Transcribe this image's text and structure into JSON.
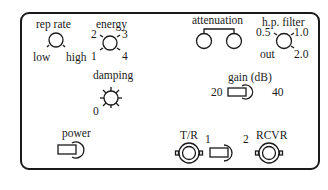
{
  "panel": {
    "rep_rate": {
      "label": "rep rate",
      "min_label": "low",
      "max_label": "high"
    },
    "energy": {
      "label": "energy",
      "positions": [
        "1",
        "2",
        "3",
        "4"
      ]
    },
    "attenuation": {
      "label": "attenuation"
    },
    "hp_filter": {
      "label": "h.p. filter",
      "positions": [
        "out",
        "0.5",
        "1.0",
        "2.0"
      ]
    },
    "damping": {
      "label": "damping",
      "min_label": "0"
    },
    "gain": {
      "label": "gain (dB)",
      "left_label": "20",
      "right_label": "40"
    },
    "power": {
      "label": "power"
    },
    "tr_connector": {
      "label": "T/R"
    },
    "selector": {
      "left_label": "1",
      "right_label": "2"
    },
    "rcvr_connector": {
      "label": "RCVR"
    }
  },
  "colors": {
    "ink": "#1a1a1a",
    "background": "#ffffff"
  }
}
